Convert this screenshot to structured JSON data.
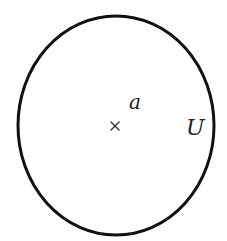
{
  "diagram": {
    "type": "set-neighborhood",
    "background": "#ffffff",
    "stroke_color": "#111111",
    "region": {
      "shape": "ellipse",
      "cx": 116,
      "cy": 125.5,
      "rx": 98,
      "ry": 109.5,
      "stroke_width": 3,
      "label": "U",
      "label_x": 186,
      "label_y": 135,
      "label_size": 22
    },
    "point": {
      "marker": "×",
      "x": 115,
      "y": 126,
      "size": 4,
      "label": "a",
      "label_x": 129,
      "label_y": 109,
      "label_size": 20
    }
  }
}
